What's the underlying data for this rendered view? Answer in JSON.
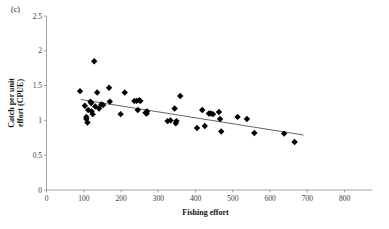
{
  "figure": {
    "panel_label": "(c)",
    "background_color": "#ffffff"
  },
  "chart_data": {
    "type": "scatter",
    "title": "",
    "subtitle": "",
    "xlabel": "Fishing effort",
    "ylabel": "Catch per unit effort (CPUE)",
    "ylabel_line1": "Catch per unit",
    "ylabel_line2": "effort (CPUE)",
    "xlim": [
      0,
      800
    ],
    "ylim": [
      0,
      2.5
    ],
    "xticks": [
      0,
      100,
      200,
      300,
      400,
      500,
      600,
      700,
      800
    ],
    "xticklabels": [
      "0",
      "100",
      "200",
      "300",
      "400",
      "500",
      "600",
      "700",
      "800"
    ],
    "yticks": [
      0,
      0.5,
      1,
      1.5,
      2,
      2.5
    ],
    "yticklabels": [
      "0",
      "0.5",
      "1",
      "1.5",
      "2",
      "2.5"
    ],
    "grid": false,
    "legend": null,
    "marker": {
      "shape": "diamond",
      "color": "#000000",
      "size": 3.2
    },
    "points": [
      {
        "x": 90,
        "y": 1.42
      },
      {
        "x": 103,
        "y": 1.21
      },
      {
        "x": 107,
        "y": 1.05
      },
      {
        "x": 107,
        "y": 1.02
      },
      {
        "x": 110,
        "y": 0.97
      },
      {
        "x": 112,
        "y": 1.15
      },
      {
        "x": 118,
        "y": 1.27
      },
      {
        "x": 120,
        "y": 1.25
      },
      {
        "x": 121,
        "y": 1.13
      },
      {
        "x": 124,
        "y": 1.09
      },
      {
        "x": 128,
        "y": 1.85
      },
      {
        "x": 131,
        "y": 1.2
      },
      {
        "x": 136,
        "y": 1.4
      },
      {
        "x": 141,
        "y": 1.17
      },
      {
        "x": 147,
        "y": 1.23
      },
      {
        "x": 152,
        "y": 1.22
      },
      {
        "x": 168,
        "y": 1.47
      },
      {
        "x": 170,
        "y": 1.27
      },
      {
        "x": 199,
        "y": 1.09
      },
      {
        "x": 210,
        "y": 1.4
      },
      {
        "x": 236,
        "y": 1.28
      },
      {
        "x": 242,
        "y": 1.28
      },
      {
        "x": 245,
        "y": 1.15
      },
      {
        "x": 249,
        "y": 1.29
      },
      {
        "x": 252,
        "y": 1.28
      },
      {
        "x": 266,
        "y": 1.11
      },
      {
        "x": 269,
        "y": 1.1
      },
      {
        "x": 270,
        "y": 1.13
      },
      {
        "x": 325,
        "y": 0.99
      },
      {
        "x": 333,
        "y": 1.0
      },
      {
        "x": 344,
        "y": 1.17
      },
      {
        "x": 347,
        "y": 0.96
      },
      {
        "x": 349,
        "y": 0.99
      },
      {
        "x": 359,
        "y": 1.35
      },
      {
        "x": 404,
        "y": 0.89
      },
      {
        "x": 418,
        "y": 1.15
      },
      {
        "x": 425,
        "y": 0.92
      },
      {
        "x": 436,
        "y": 1.1
      },
      {
        "x": 441,
        "y": 1.1
      },
      {
        "x": 447,
        "y": 1.09
      },
      {
        "x": 463,
        "y": 1.12
      },
      {
        "x": 466,
        "y": 1.02
      },
      {
        "x": 469,
        "y": 0.84
      },
      {
        "x": 513,
        "y": 1.05
      },
      {
        "x": 538,
        "y": 1.02
      },
      {
        "x": 558,
        "y": 0.82
      },
      {
        "x": 638,
        "y": 0.81
      },
      {
        "x": 666,
        "y": 0.69
      }
    ],
    "trendline": {
      "type": "linear",
      "x_start": 92,
      "y_start": 1.3,
      "x_end": 690,
      "y_end": 0.79,
      "color": "#555555"
    }
  }
}
